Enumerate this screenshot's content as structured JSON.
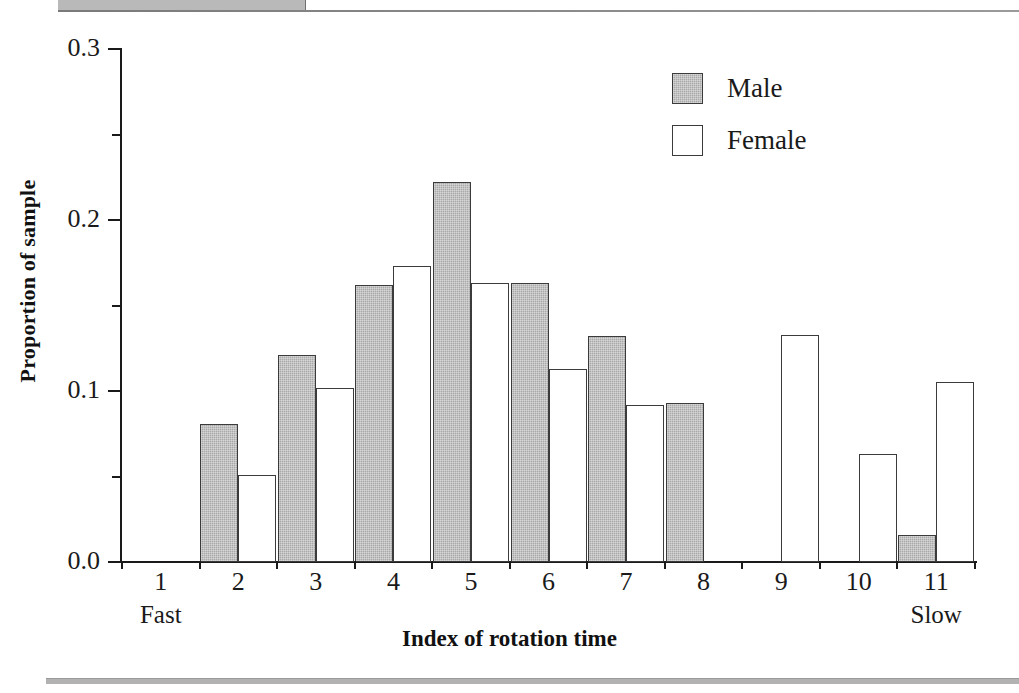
{
  "chart_data": {
    "type": "bar",
    "title": "",
    "xlabel": "Index of rotation time",
    "ylabel": "Proportion of sample",
    "categories": [
      "1",
      "2",
      "3",
      "4",
      "5",
      "6",
      "7",
      "8",
      "9",
      "10",
      "11"
    ],
    "series": [
      {
        "name": "Male",
        "color": "#a9a9a9",
        "values": [
          0.0,
          0.081,
          0.121,
          0.162,
          0.222,
          0.163,
          0.132,
          0.093,
          0.0,
          0.0,
          0.016
        ]
      },
      {
        "name": "Female",
        "color": "#ffffff",
        "values": [
          0.0,
          0.051,
          0.102,
          0.173,
          0.163,
          0.113,
          0.092,
          0.0,
          0.133,
          0.063,
          0.105
        ]
      }
    ],
    "ylim": [
      0.0,
      0.3
    ],
    "y_major_ticks": [
      "0.0",
      "0.1",
      "0.2",
      "0.3"
    ],
    "y_minor_ticks": [
      "0.05",
      "0.15",
      "0.25"
    ],
    "grid": false,
    "legend_position": "top-right",
    "x_axis_endcaps": {
      "left": "Fast",
      "right": "Slow"
    }
  },
  "legend": {
    "entries": [
      {
        "label": "Male"
      },
      {
        "label": "Female"
      }
    ]
  },
  "axis": {
    "y_title": "Proportion of sample",
    "x_title": "Index of rotation time",
    "y_labels": [
      "0.3",
      "0.2",
      "0.1",
      "0.0"
    ],
    "x_labels": [
      "1",
      "2",
      "3",
      "4",
      "5",
      "6",
      "7",
      "8",
      "9",
      "10",
      "11"
    ],
    "fast_label": "Fast",
    "slow_label": "Slow"
  }
}
